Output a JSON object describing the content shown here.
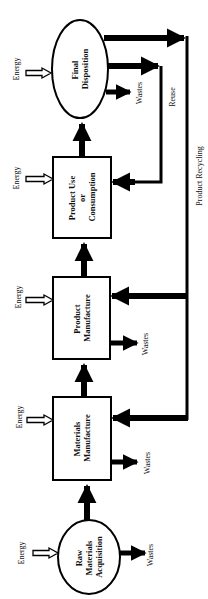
{
  "diagram": {
    "orientation": "rotated-90-ccw",
    "colors": {
      "stroke": "#000000",
      "background": "#ffffff",
      "text": "#111111"
    },
    "stages": [
      {
        "id": "raw",
        "shape": "ellipse",
        "lines": [
          "Raw",
          "Materials",
          "Acquisition"
        ]
      },
      {
        "id": "materials",
        "shape": "box",
        "lines": [
          "Materials",
          "Manufacture"
        ]
      },
      {
        "id": "product",
        "shape": "box",
        "lines": [
          "Product",
          "Manufacture"
        ]
      },
      {
        "id": "use",
        "shape": "box",
        "lines": [
          "Product Use",
          "or",
          "Consumption"
        ]
      },
      {
        "id": "final",
        "shape": "ellipse",
        "lines": [
          "Final",
          "Disposition"
        ]
      }
    ],
    "energy_label": "Energy",
    "wastes_label": "Wastes",
    "reuse_label": "Reuse",
    "recycling_label": "Product Recycling"
  }
}
